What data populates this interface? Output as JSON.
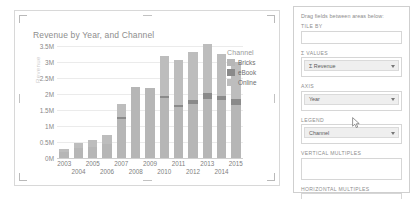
{
  "chart_card": {
    "title": "Revenue by Year, and Channel"
  },
  "chart_data": {
    "type": "bar",
    "stacked": true,
    "title": "Revenue by Year, and Channel",
    "xlabel": "",
    "ylabel": "Revenue",
    "ylim": [
      0,
      3500000
    ],
    "grid": true,
    "legend_position": "right",
    "legend_title": "Channel",
    "ytick_labels": [
      "3.5M",
      "3M",
      "2.5M",
      "2M",
      "1.5M",
      "1M",
      "0.5M",
      "0M"
    ],
    "ytick_values": [
      3500000,
      3000000,
      2500000,
      2000000,
      1500000,
      1000000,
      500000,
      0
    ],
    "categories": [
      "2003",
      "2004",
      "2005",
      "2006",
      "2007",
      "2008",
      "2009",
      "2010",
      "2011",
      "2012",
      "2013",
      "2014",
      "2015"
    ],
    "series": [
      {
        "name": "Bricks",
        "color": "#b6b6b6",
        "values": [
          180000,
          300000,
          330000,
          430000,
          1230000,
          2230000,
          2180000,
          1870000,
          1600000,
          1700000,
          1850000,
          1800000,
          1650000
        ]
      },
      {
        "name": "eBook",
        "color": "#8a8a8a",
        "values": [
          0,
          0,
          0,
          0,
          40000,
          0,
          0,
          70000,
          70000,
          100000,
          180000,
          130000,
          190000
        ]
      },
      {
        "name": "Online",
        "color": "#bdbdbd",
        "values": [
          110000,
          160000,
          220000,
          290000,
          410000,
          0,
          0,
          1260000,
          1400000,
          1520000,
          1520000,
          1320000,
          1160000
        ]
      }
    ],
    "totals": [
      290000,
      460000,
      550000,
      720000,
      1680000,
      2230000,
      2180000,
      3200000,
      3070000,
      3320000,
      3550000,
      3250000,
      3000000
    ]
  },
  "legend": {
    "title": "Channel",
    "items": [
      {
        "label": "Bricks",
        "color": "#b6b6b6"
      },
      {
        "label": "eBook",
        "color": "#8a8a8a"
      },
      {
        "label": "Online",
        "color": "#bdbdbd"
      }
    ]
  },
  "field_panel": {
    "hint": "Drag fields between areas below:",
    "wells": [
      {
        "label": "TILE BY",
        "field": null
      },
      {
        "label": "Σ VALUES",
        "field": "Σ Revenue",
        "has_caret": true
      },
      {
        "label": "AXIS",
        "field": "Year",
        "has_caret": true
      },
      {
        "label": "LEGEND",
        "field": "Channel",
        "has_caret": true
      },
      {
        "label": "VERTICAL MULTIPLES",
        "field": null
      },
      {
        "label": "HORIZONTAL MULTIPLES",
        "field": null
      }
    ]
  }
}
